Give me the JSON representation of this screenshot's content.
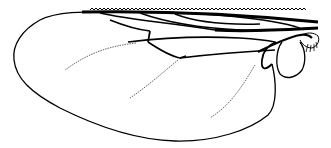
{
  "figure": {
    "colors": {
      "background": "#ffffff",
      "ink": "#000000",
      "faint_vein": "#555555"
    }
  }
}
